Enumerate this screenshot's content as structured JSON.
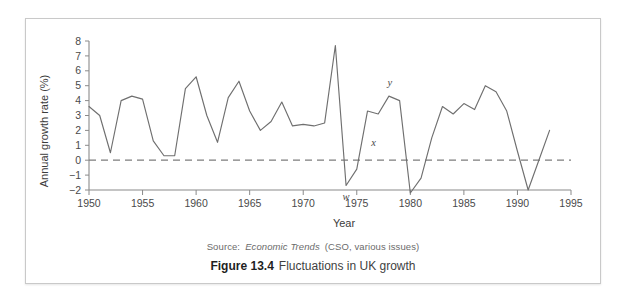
{
  "figure": {
    "number_label": "Figure 13.4",
    "title_text": "Fluctuations in UK growth",
    "source_prefix": "Source:",
    "source_italic": "Economic Trends",
    "source_suffix": "(CSO, various issues)"
  },
  "chart_data": {
    "type": "line",
    "title": "Fluctuations in UK growth",
    "xlabel": "Year",
    "ylabel": "Annual growth rate (%)",
    "xlim": [
      1950,
      1995
    ],
    "ylim": [
      -2.6,
      8
    ],
    "grid": false,
    "legend": "none",
    "xticks": [
      1950,
      1955,
      1960,
      1965,
      1970,
      1975,
      1980,
      1985,
      1990,
      1995
    ],
    "yticks": [
      -2,
      -1,
      0,
      1,
      2,
      3,
      4,
      5,
      6,
      7,
      8
    ],
    "zero_reference_line": 0,
    "series": [
      {
        "name": "UK annual growth rate",
        "color": "#6f6f6f",
        "x": [
          1950,
          1951,
          1952,
          1953,
          1954,
          1955,
          1956,
          1957,
          1958,
          1959,
          1960,
          1961,
          1962,
          1963,
          1964,
          1965,
          1966,
          1967,
          1968,
          1969,
          1970,
          1971,
          1972,
          1973,
          1974,
          1975,
          1976,
          1977,
          1978,
          1979,
          1980,
          1981,
          1982,
          1983,
          1984,
          1985,
          1986,
          1987,
          1988,
          1989,
          1990,
          1991,
          1992,
          1993
        ],
        "values": [
          3.6,
          3.0,
          0.5,
          4.0,
          4.3,
          4.1,
          1.3,
          0.3,
          0.3,
          4.8,
          5.6,
          3.0,
          1.2,
          4.2,
          5.3,
          3.3,
          2.0,
          2.6,
          3.9,
          2.3,
          2.4,
          2.3,
          2.5,
          7.7,
          -1.7,
          -0.6,
          3.3,
          3.1,
          4.3,
          4.0,
          -2.2,
          -1.2,
          1.5,
          3.6,
          3.1,
          3.8,
          3.4,
          5.0,
          4.6,
          3.3,
          0.6,
          -2.0,
          0.0,
          2.0
        ]
      }
    ],
    "annotations": [
      {
        "label": "w",
        "x": 1974,
        "y": -1.7,
        "note": "trough marker"
      },
      {
        "label": "x",
        "x": 1976,
        "y": 0.6,
        "note": "zero-crossing marker"
      },
      {
        "label": "y",
        "x": 1978,
        "y": 4.5,
        "note": "peak marker"
      }
    ]
  }
}
